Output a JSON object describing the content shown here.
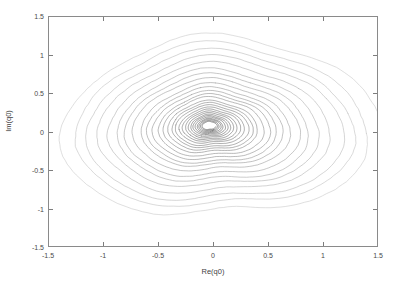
{
  "figure": {
    "width": 396,
    "height": 291,
    "background": "#ffffff",
    "frame_color": "#8a8a8a"
  },
  "axes": {
    "x_title": "Re(q0)",
    "y_title": "Im(q0)",
    "x_ticks": [
      "-1.5",
      "-1",
      "-0.5",
      "0",
      "0.5",
      "1",
      "1.5"
    ],
    "y_ticks": [
      "1.5",
      "1",
      "0.5",
      "0",
      "-0.5",
      "-1",
      "-1.5"
    ],
    "tick_direction": "in",
    "box": true
  },
  "chart_data": {
    "type": "line",
    "title": "",
    "xlabel": "Re(q0)",
    "ylabel": "Im(q0)",
    "xlim": [
      -1.5,
      1.5
    ],
    "ylim": [
      -1.5,
      1.5
    ],
    "x_ticks": [
      -1.5,
      -1,
      -0.5,
      0,
      0.5,
      1,
      1.5
    ],
    "y_ticks": [
      -1.5,
      -1,
      -0.5,
      0,
      0.5,
      1,
      1.5
    ],
    "grid": false,
    "legend": "none",
    "series": [
      {
        "name": "q0 trajectory",
        "color": "#4a4a4a",
        "line_width": 0.55,
        "fade_outer_to_inner": true,
        "outer_color": "#c9c9c9",
        "inner_color": "#303030",
        "generator": {
          "kind": "decaying-perturbed-spiral",
          "turns": 27,
          "points_per_turn": 170,
          "r_start": 1.4,
          "r_end": 0.055,
          "decay": 2.35,
          "center_x": 0.055,
          "center_y": 0.015,
          "center_drift_x": -0.09,
          "center_drift_y": 0.06,
          "ellipse_a": 1.0,
          "ellipse_b": 0.93,
          "tilt_deg": -14,
          "wobble": [
            {
              "harmonic": 2,
              "amp": 0.085,
              "phase": 0.8
            },
            {
              "harmonic": 3,
              "amp": 0.055,
              "phase": 2.1
            },
            {
              "harmonic": 5,
              "amp": 0.022,
              "phase": 4.4
            },
            {
              "harmonic": 7,
              "amp": 0.013,
              "phase": 1.2
            }
          ],
          "radial_jitter": 0.035,
          "angular_jitter": 0.03,
          "seed": 20240517
        }
      }
    ],
    "annotations": []
  }
}
